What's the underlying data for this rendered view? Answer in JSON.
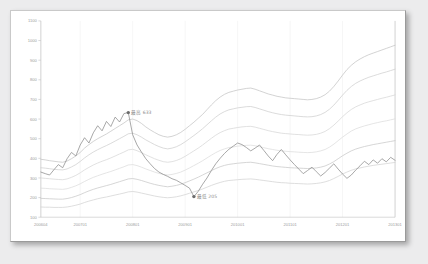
{
  "chart_data": {
    "type": "line",
    "title": "",
    "subtitle": "",
    "xlabel": "",
    "ylabel": "",
    "ylim": [
      100,
      1100
    ],
    "xlim": [
      0,
      82
    ],
    "grid": "vertical-only",
    "legend": "none",
    "yticks": [
      1100,
      1000,
      900,
      800,
      700,
      600,
      500,
      400,
      300,
      200,
      100
    ],
    "xticks": [
      "200604",
      "200701",
      "200801",
      "200901",
      "201001",
      "201101",
      "201201",
      "201301"
    ],
    "xtick_positions": [
      0,
      9,
      21,
      33,
      45,
      57,
      69,
      81
    ],
    "annotations": [
      {
        "name": "peak-high",
        "label": "最高 633",
        "value": 633,
        "x_index": 20,
        "marker": "dot"
      },
      {
        "name": "trough-low",
        "label": "最低 205",
        "value": 205,
        "x_index": 35,
        "marker": "dot"
      }
    ],
    "x": [
      0,
      1,
      2,
      3,
      4,
      5,
      6,
      7,
      8,
      9,
      10,
      11,
      12,
      13,
      14,
      15,
      16,
      17,
      18,
      19,
      20,
      21,
      22,
      23,
      24,
      25,
      26,
      27,
      28,
      29,
      30,
      31,
      32,
      33,
      34,
      35,
      36,
      37,
      38,
      39,
      40,
      41,
      42,
      43,
      44,
      45,
      46,
      47,
      48,
      49,
      50,
      51,
      52,
      53,
      54,
      55,
      56,
      57,
      58,
      59,
      60,
      61,
      62,
      63,
      64,
      65,
      66,
      67,
      68,
      69,
      70,
      71,
      72,
      73,
      74,
      75,
      76,
      77,
      78,
      79,
      80,
      81
    ],
    "series": [
      {
        "name": "series-1",
        "color": "#c4c4c4",
        "values": [
          395,
          392,
          388,
          385,
          382,
          380,
          386,
          398,
          412,
          430,
          452,
          470,
          486,
          500,
          512,
          524,
          538,
          552,
          566,
          580,
          596,
          600,
          592,
          578,
          560,
          545,
          532,
          520,
          512,
          508,
          512,
          520,
          532,
          548,
          566,
          584,
          604,
          624,
          648,
          672,
          694,
          712,
          726,
          736,
          742,
          748,
          752,
          756,
          758,
          752,
          744,
          736,
          728,
          722,
          716,
          712,
          708,
          706,
          704,
          702,
          700,
          698,
          700,
          704,
          712,
          724,
          742,
          766,
          794,
          824,
          852,
          874,
          892,
          906,
          918,
          928,
          936,
          944,
          952,
          960,
          968,
          976
        ]
      },
      {
        "name": "series-2",
        "color": "#cfcfcf",
        "values": [
          352,
          350,
          347,
          344,
          342,
          341,
          346,
          356,
          368,
          384,
          402,
          418,
          432,
          444,
          455,
          465,
          476,
          488,
          500,
          512,
          525,
          528,
          520,
          508,
          494,
          482,
          470,
          460,
          452,
          448,
          452,
          459,
          470,
          484,
          500,
          516,
          533,
          551,
          571,
          591,
          610,
          626,
          638,
          647,
          652,
          657,
          660,
          663,
          664,
          659,
          652,
          645,
          638,
          632,
          627,
          623,
          620,
          618,
          616,
          614,
          612,
          611,
          612,
          616,
          623,
          634,
          650,
          671,
          696,
          722,
          746,
          766,
          782,
          794,
          804,
          813,
          820,
          827,
          834,
          840,
          847,
          854
        ]
      },
      {
        "name": "series-3",
        "color": "#d6d6d6",
        "values": [
          300,
          298,
          296,
          294,
          292,
          291,
          295,
          303,
          313,
          326,
          341,
          354,
          366,
          376,
          385,
          393,
          402,
          412,
          422,
          432,
          443,
          446,
          439,
          429,
          418,
          408,
          398,
          390,
          383,
          380,
          383,
          389,
          398,
          410,
          424,
          438,
          452,
          468,
          485,
          502,
          518,
          531,
          541,
          549,
          553,
          557,
          560,
          562,
          563,
          559,
          553,
          547,
          541,
          536,
          532,
          528,
          526,
          524,
          522,
          521,
          519,
          518,
          519,
          522,
          528,
          537,
          551,
          569,
          590,
          612,
          632,
          649,
          662,
          672,
          681,
          688,
          694,
          700,
          706,
          711,
          717,
          723
        ]
      },
      {
        "name": "series-4",
        "color": "#dcdcdc",
        "values": [
          248,
          247,
          245,
          244,
          243,
          242,
          245,
          252,
          260,
          270,
          282,
          293,
          303,
          311,
          319,
          326,
          333,
          341,
          349,
          357,
          366,
          368,
          363,
          355,
          346,
          338,
          330,
          323,
          318,
          315,
          318,
          323,
          330,
          340,
          351,
          363,
          375,
          388,
          402,
          416,
          429,
          440,
          448,
          455,
          458,
          462,
          464,
          466,
          467,
          464,
          459,
          454,
          449,
          445,
          441,
          438,
          436,
          434,
          433,
          431,
          430,
          429,
          430,
          433,
          438,
          445,
          457,
          472,
          490,
          508,
          524,
          539,
          550,
          558,
          565,
          571,
          577,
          582,
          587,
          591,
          596,
          601
        ]
      },
      {
        "name": "series-5",
        "color": "#c8c8c8",
        "values": [
          196,
          195,
          194,
          193,
          192,
          192,
          195,
          200,
          207,
          215,
          225,
          234,
          242,
          249,
          255,
          261,
          267,
          274,
          281,
          288,
          295,
          297,
          293,
          287,
          280,
          273,
          267,
          262,
          258,
          255,
          258,
          262,
          268,
          276,
          285,
          294,
          304,
          315,
          326,
          337,
          348,
          357,
          364,
          369,
          372,
          375,
          377,
          379,
          380,
          377,
          373,
          369,
          365,
          361,
          358,
          356,
          354,
          352,
          351,
          350,
          349,
          348,
          349,
          351,
          355,
          361,
          371,
          383,
          398,
          413,
          426,
          438,
          447,
          454,
          460,
          465,
          470,
          474,
          478,
          482,
          486,
          490
        ]
      },
      {
        "name": "series-6",
        "color": "#d2d2d2",
        "values": [
          152,
          151,
          151,
          150,
          150,
          150,
          152,
          156,
          161,
          167,
          175,
          182,
          188,
          194,
          199,
          203,
          208,
          213,
          218,
          223,
          229,
          231,
          228,
          223,
          218,
          213,
          208,
          204,
          201,
          199,
          201,
          204,
          209,
          215,
          222,
          229,
          236,
          244,
          253,
          262,
          270,
          277,
          283,
          287,
          289,
          291,
          293,
          294,
          295,
          293,
          290,
          287,
          284,
          281,
          278,
          276,
          275,
          273,
          272,
          271,
          270,
          269,
          270,
          272,
          275,
          280,
          287,
          297,
          308,
          320,
          330,
          339,
          346,
          351,
          356,
          360,
          364,
          367,
          370,
          373,
          376,
          379
        ]
      },
      {
        "name": "series-highlight",
        "color": "#8a8a8a",
        "values": [
          330,
          322,
          315,
          342,
          368,
          352,
          398,
          430,
          412,
          468,
          505,
          478,
          530,
          566,
          540,
          588,
          562,
          610,
          585,
          628,
          633,
          520,
          468,
          432,
          398,
          372,
          348,
          330,
          318,
          308,
          296,
          288,
          275,
          262,
          248,
          205,
          232,
          268,
          300,
          338,
          372,
          400,
          425,
          446,
          462,
          478,
          470,
          455,
          438,
          452,
          468,
          440,
          412,
          388,
          420,
          445,
          418,
          392,
          368,
          345,
          322,
          338,
          355,
          332,
          310,
          328,
          350,
          372,
          345,
          320,
          298,
          315,
          340,
          362,
          385,
          368,
          392,
          375,
          398,
          382,
          405,
          390
        ]
      }
    ]
  }
}
